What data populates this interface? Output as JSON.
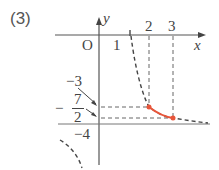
{
  "problem_label": "(3)",
  "axes": {
    "x_label": "x",
    "y_label": "y",
    "origin_label": "O"
  },
  "x_ticks": [
    {
      "label": "1",
      "value": 1
    },
    {
      "label": "2",
      "value": 2
    },
    {
      "label": "3",
      "value": 3
    }
  ],
  "y_ticks": [
    {
      "label": "−3",
      "value": -3
    },
    {
      "label": "−7/2",
      "value": -3.5,
      "sign": "−",
      "numerator": "7",
      "denominator": "2"
    },
    {
      "label": "−4",
      "value": -4
    }
  ],
  "asymptotes": {
    "vertical": "x = 1",
    "horizontal": "y = -4"
  },
  "highlight_segment": {
    "from": {
      "x": 2,
      "y": -3
    },
    "to": {
      "x": 3,
      "y": -3.5
    },
    "color": "#e8553a"
  },
  "colors": {
    "axis": "#555555",
    "dashed": "#555555",
    "highlight": "#e8553a"
  }
}
